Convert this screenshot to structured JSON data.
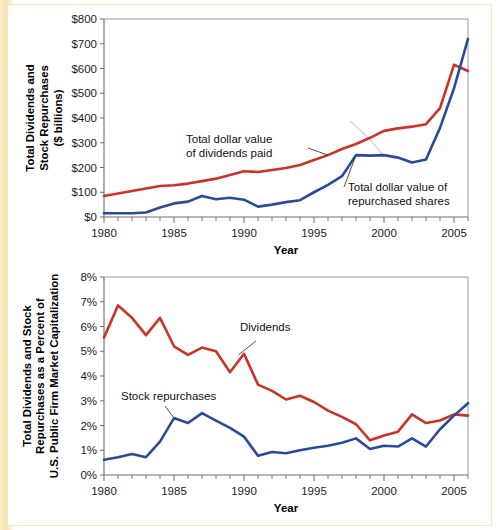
{
  "figure": {
    "background_color": "#f7e6b8",
    "plot_background": "#ffffff",
    "series_colors": {
      "dividends": "#cc3326",
      "repurchases": "#2a4b9b"
    }
  },
  "chart_data": [
    {
      "type": "line",
      "id": "top",
      "title": "",
      "xlabel": "Year",
      "ylabel": "Total Dividends and Stock Repurchases ($ billions)",
      "ylabel_line1": "Total Dividends and",
      "ylabel_line2": "Stock Repurchases",
      "ylabel_line3": "($ billions)",
      "grid": false,
      "legend_position": "inline-annotations",
      "xlim": [
        1980,
        2006
      ],
      "ylim": [
        0,
        800
      ],
      "xticks": [
        1980,
        1985,
        1990,
        1995,
        2000,
        2005
      ],
      "xticklabels": [
        "1980",
        "1985",
        "1990",
        "1995",
        "2000",
        "2005"
      ],
      "yticks": [
        0,
        100,
        200,
        300,
        400,
        500,
        600,
        700,
        800
      ],
      "yticklabels": [
        "$0",
        "$100",
        "$200",
        "$300",
        "$400",
        "$500",
        "$600",
        "$700",
        "$800"
      ],
      "x": [
        1980,
        1981,
        1982,
        1983,
        1984,
        1985,
        1986,
        1987,
        1988,
        1989,
        1990,
        1991,
        1992,
        1993,
        1994,
        1995,
        1996,
        1997,
        1998,
        1999,
        2000,
        2001,
        2002,
        2003,
        2004,
        2005,
        2006
      ],
      "series": [
        {
          "name": "Total dollar value of dividends paid",
          "color": "#cc3326",
          "values": [
            85,
            95,
            105,
            115,
            125,
            128,
            135,
            145,
            155,
            170,
            185,
            182,
            190,
            198,
            210,
            230,
            250,
            275,
            295,
            320,
            348,
            358,
            365,
            375,
            440,
            615,
            590
          ]
        },
        {
          "name": "Total dollar value of repurchased shares",
          "color": "#2a4b9b",
          "values": [
            15,
            15,
            15,
            18,
            38,
            55,
            62,
            85,
            72,
            78,
            70,
            42,
            50,
            60,
            68,
            100,
            130,
            165,
            250,
            248,
            250,
            240,
            220,
            232,
            360,
            520,
            720
          ]
        }
      ],
      "annotations": [
        {
          "text_line1": "Total dollar value",
          "text_line2": "of dividends paid",
          "target_x": 1996,
          "target_y": 250
        },
        {
          "text_line1": "Total dollar value of",
          "text_line2": "repurchased shares",
          "target_x": 1998,
          "target_y": 250
        }
      ]
    },
    {
      "type": "line",
      "id": "bottom",
      "title": "",
      "xlabel": "Year",
      "ylabel": "Total Dividends and Stock Repurchases as a Percent of U.S. Public Firm Market Capitalization",
      "ylabel_line1": "Total Dividends and Stock",
      "ylabel_line2": "Repurchases as a Percent of",
      "ylabel_line3": "U.S. Public Firm Market Capitalization",
      "grid": false,
      "legend_position": "inline-annotations",
      "xlim": [
        1980,
        2006
      ],
      "ylim": [
        0,
        8
      ],
      "xticks": [
        1980,
        1985,
        1990,
        1995,
        2000,
        2005
      ],
      "xticklabels": [
        "1980",
        "1985",
        "1990",
        "1995",
        "2000",
        "2005"
      ],
      "yticks": [
        0,
        1,
        2,
        3,
        4,
        5,
        6,
        7,
        8
      ],
      "yticklabels": [
        "0%",
        "1%",
        "2%",
        "3%",
        "4%",
        "5%",
        "6%",
        "7%",
        "8%"
      ],
      "x": [
        1980,
        1981,
        1982,
        1983,
        1984,
        1985,
        1986,
        1987,
        1988,
        1989,
        1990,
        1991,
        1992,
        1993,
        1994,
        1995,
        1996,
        1997,
        1998,
        1999,
        2000,
        2001,
        2002,
        2003,
        2004,
        2005,
        2006
      ],
      "series": [
        {
          "name": "Dividends",
          "color": "#cc3326",
          "values": [
            5.55,
            6.85,
            6.35,
            5.65,
            6.35,
            5.2,
            4.85,
            5.15,
            5.0,
            4.15,
            4.9,
            3.65,
            3.4,
            3.05,
            3.2,
            2.95,
            2.6,
            2.35,
            2.05,
            1.4,
            1.6,
            1.75,
            2.45,
            2.1,
            2.2,
            2.45,
            2.4
          ]
        },
        {
          "name": "Stock repurchases",
          "color": "#2a4b9b",
          "values": [
            0.62,
            0.72,
            0.85,
            0.72,
            1.35,
            2.3,
            2.1,
            2.5,
            2.2,
            1.9,
            1.55,
            0.78,
            0.93,
            0.88,
            1.0,
            1.1,
            1.18,
            1.3,
            1.48,
            1.05,
            1.18,
            1.15,
            1.48,
            1.15,
            1.85,
            2.4,
            2.9
          ]
        }
      ],
      "annotations": [
        {
          "text_line1": "Dividends",
          "text_line2": "",
          "target_x": 1989.6,
          "target_y": 4.85
        },
        {
          "text_line1": "Stock repurchases",
          "text_line2": "",
          "target_x": 1985,
          "target_y": 2.3
        }
      ]
    }
  ]
}
